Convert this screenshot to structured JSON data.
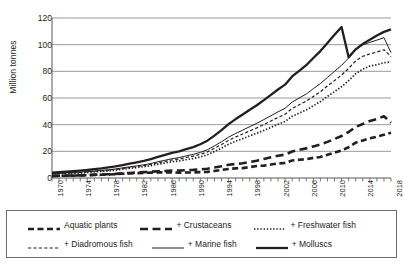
{
  "chart_data": {
    "type": "line",
    "title": "",
    "xlabel": "",
    "ylabel": "Million tonnes",
    "ylim": [
      0,
      120
    ],
    "ytick_values": [
      0,
      20,
      40,
      60,
      80,
      100,
      120
    ],
    "ytick_labels": [
      "0",
      "20",
      "40",
      "60",
      "80",
      "100",
      "120"
    ],
    "xlim": [
      1970,
      2018
    ],
    "x": [
      1970,
      1971,
      1972,
      1973,
      1974,
      1975,
      1976,
      1977,
      1978,
      1979,
      1980,
      1981,
      1982,
      1983,
      1984,
      1985,
      1986,
      1987,
      1988,
      1989,
      1990,
      1991,
      1992,
      1993,
      1994,
      1995,
      1996,
      1997,
      1998,
      1999,
      2000,
      2001,
      2002,
      2003,
      2004,
      2005,
      2006,
      2007,
      2008,
      2009,
      2010,
      2011,
      2012,
      2013,
      2014,
      2015,
      2016,
      2017,
      2018
    ],
    "xtick_labels": [
      "1970",
      "1974",
      "1978",
      "1982",
      "1986",
      "1990",
      "1994",
      "1998",
      "2002",
      "2006",
      "2010",
      "2014",
      "2018"
    ],
    "xtick_values": [
      1970,
      1974,
      1978,
      1982,
      1986,
      1990,
      1994,
      1998,
      2002,
      2006,
      2010,
      2014,
      2018
    ],
    "xtick_minor_step": 1,
    "grid": "horizontal",
    "legend_position": "below-plot",
    "cumulative": true,
    "line_color": "#231f20",
    "grid_color": "#808080",
    "axis_color": "#595959",
    "background": "#ffffff",
    "series": [
      {
        "name": "Aquatic plants",
        "legend_label": "Aquatic plants",
        "style": "dashed-thick",
        "values": [
          1.5,
          1.6,
          1.7,
          1.8,
          1.9,
          2.1,
          2.3,
          2.4,
          2.6,
          2.8,
          3.2,
          3.4,
          3.6,
          3.8,
          4.0,
          4.2,
          4.2,
          4.2,
          4.0,
          4.1,
          4.2,
          4.4,
          4.6,
          5.3,
          6.0,
          6.8,
          7.2,
          7.4,
          8.2,
          9.0,
          9.3,
          10.1,
          10.9,
          11.2,
          13.1,
          13.7,
          14.1,
          15.1,
          15.8,
          17.4,
          19.0,
          20.6,
          23.1,
          26.5,
          28.1,
          29.8,
          31.0,
          32.5,
          33.9
        ]
      },
      {
        "name": "+ Crustaceans",
        "legend_label": "+ Crustaceans",
        "style": "dashed-thick-long",
        "values": [
          1.6,
          1.7,
          1.8,
          1.9,
          2.0,
          2.2,
          2.5,
          2.6,
          2.8,
          3.1,
          3.5,
          3.8,
          4.1,
          4.4,
          4.7,
          5.1,
          5.3,
          5.6,
          5.6,
          5.9,
          6.1,
          6.5,
          7.0,
          7.9,
          8.8,
          9.9,
          10.5,
          11.0,
          12.0,
          13.0,
          14.3,
          15.5,
          16.7,
          17.5,
          19.9,
          21.2,
          22.2,
          23.7,
          25.1,
          27.1,
          29.3,
          31.5,
          34.5,
          38.3,
          40.5,
          42.7,
          44.3,
          46.3,
          41.5
        ]
      },
      {
        "name": "+ Freshwater fish",
        "legend_label": "+ Freshwater fish",
        "style": "dotted",
        "values": [
          2.9,
          3.1,
          3.3,
          3.5,
          3.8,
          4.1,
          4.6,
          4.9,
          5.3,
          5.9,
          6.6,
          7.2,
          7.8,
          8.5,
          9.3,
          10.4,
          11.2,
          12.2,
          12.8,
          13.8,
          14.6,
          15.8,
          17.4,
          19.9,
          22.4,
          25.3,
          27.6,
          29.5,
          31.6,
          33.6,
          35.7,
          38.0,
          40.3,
          42.4,
          46.3,
          48.7,
          51.0,
          54.2,
          57.3,
          61.2,
          64.8,
          68.5,
          73.0,
          78.2,
          81.6,
          84.0,
          84.9,
          86.5,
          87.0
        ]
      },
      {
        "name": "+ Diadromous fish",
        "legend_label": "+ Diadromous fish",
        "style": "dashed-thin",
        "values": [
          3.2,
          3.4,
          3.6,
          3.9,
          4.2,
          4.5,
          5.0,
          5.4,
          5.8,
          6.4,
          7.2,
          7.9,
          8.5,
          9.3,
          10.2,
          11.4,
          12.4,
          13.5,
          14.2,
          15.4,
          16.4,
          17.8,
          19.6,
          22.3,
          25.1,
          28.2,
          30.8,
          33.0,
          35.3,
          37.6,
          40.1,
          42.8,
          45.4,
          47.8,
          52.1,
          54.9,
          57.6,
          61.2,
          64.7,
          69.0,
          73.1,
          77.2,
          82.2,
          87.8,
          91.3,
          93.0,
          94.5,
          96.2,
          91.0
        ]
      },
      {
        "name": "+ Marine fish",
        "legend_label": "+ Marine fish",
        "style": "solid-thin",
        "values": [
          3.4,
          3.6,
          3.8,
          4.1,
          4.4,
          4.8,
          5.3,
          5.7,
          6.2,
          6.8,
          7.6,
          8.4,
          9.1,
          9.9,
          10.9,
          12.2,
          13.3,
          14.5,
          15.3,
          16.6,
          17.7,
          19.2,
          21.2,
          24.1,
          27.2,
          30.6,
          33.4,
          35.9,
          38.5,
          41.0,
          43.8,
          46.7,
          49.6,
          52.3,
          56.9,
          60.0,
          63.0,
          67.0,
          70.8,
          75.4,
          80.0,
          84.5,
          90.0,
          96.0,
          99.8,
          101.7,
          103.4,
          105.3,
          94.0
        ]
      },
      {
        "name": "+ Molluscs",
        "legend_label": "+ Molluscs",
        "style": "solid-thick",
        "values": [
          4.1,
          4.4,
          4.7,
          5.1,
          5.5,
          6.0,
          6.7,
          7.2,
          7.9,
          8.7,
          9.7,
          10.7,
          11.7,
          12.8,
          14.1,
          15.8,
          17.3,
          18.9,
          20.0,
          21.7,
          23.2,
          25.3,
          28.0,
          31.8,
          35.9,
          40.4,
          44.2,
          47.6,
          51.2,
          54.6,
          58.4,
          62.4,
          66.4,
          70.0,
          76.2,
          80.4,
          84.6,
          90.0,
          95.2,
          101.3,
          107.4,
          113.3,
          90.5,
          96.5,
          100.6,
          103.7,
          106.9,
          109.6,
          111.5
        ]
      }
    ]
  },
  "legend": {
    "rows": [
      [
        "Aquatic plants",
        "+ Crustaceans",
        "+ Freshwater fish"
      ],
      [
        "+ Diadromous fish",
        "+ Marine fish",
        "+ Molluscs"
      ]
    ]
  }
}
